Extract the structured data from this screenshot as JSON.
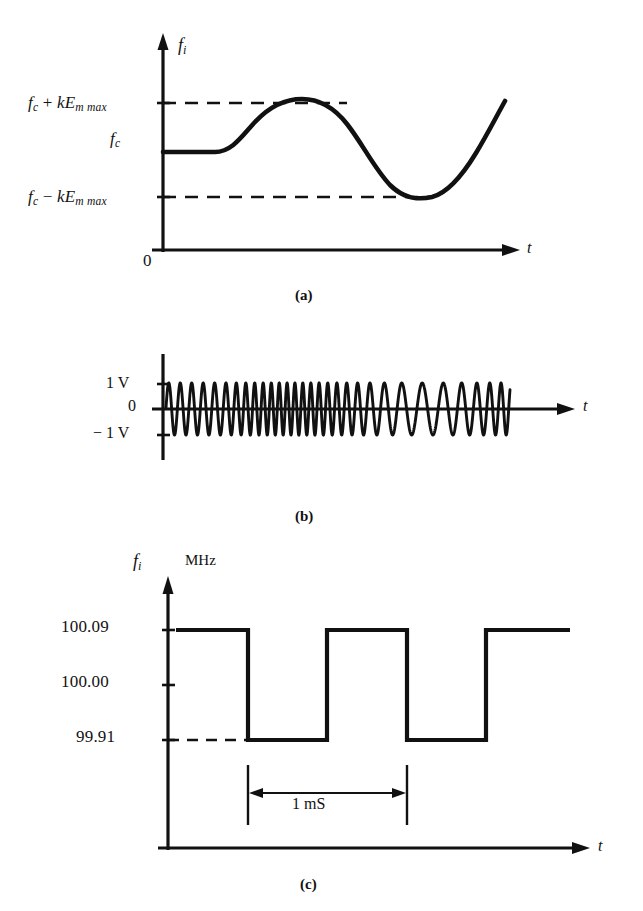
{
  "figure": {
    "title_fragment": "",
    "panels": [
      {
        "id": "a",
        "caption": "(a)",
        "y_axis_label": "f",
        "y_axis_sub": "i",
        "x_axis_label": "t",
        "origin_label": "0",
        "ticks": [
          {
            "text_pre": "f",
            "sub1": "c",
            "op": " + ",
            "text_k": "kE",
            "sub2": "m max",
            "full": "f_c + kE_m max",
            "value_kind": "upper-deviation"
          },
          {
            "text_pre": "f",
            "sub1": "c",
            "op": "",
            "text_k": "",
            "sub2": "",
            "full": "f_c",
            "value_kind": "carrier"
          },
          {
            "text_pre": "f",
            "sub1": "c",
            "op": " − ",
            "text_k": "kE",
            "sub2": "m max",
            "full": "f_c - kE_m max",
            "value_kind": "lower-deviation"
          }
        ]
      },
      {
        "id": "b",
        "caption": "(b)",
        "x_axis_label": "t",
        "ticks": [
          "1 V",
          "0",
          "− 1 V"
        ]
      },
      {
        "id": "c",
        "caption": "(c)",
        "y_axis_label": "f",
        "y_axis_sub": "i",
        "y_axis_unit": "MHz",
        "x_axis_label": "t",
        "ticks": [
          "100.09",
          "100.00",
          "99.91"
        ],
        "period_label": "1 mS"
      }
    ]
  },
  "chart_data": [
    {
      "type": "line",
      "panel": "a",
      "title": "Instantaneous frequency vs time (analog modulation)",
      "xlabel": "t",
      "ylabel": "f_i",
      "ytick_labels": [
        "f_c + kE_m max",
        "f_c",
        "f_c - kE_m max"
      ],
      "ytick_values": [
        1,
        0,
        -1
      ],
      "ylim": [
        -1.6,
        1.35
      ],
      "grid": false,
      "legend": null,
      "annotations": [
        "dashed guide line at f_c + kE_m max",
        "dashed guide line at f_c - kE_m max",
        "origin marked 0"
      ],
      "series": [
        {
          "name": "f_i(t)",
          "x": [
            0.0,
            0.05,
            0.1,
            0.15,
            0.175,
            0.21,
            0.25,
            0.3,
            0.35,
            0.4,
            0.45,
            0.5,
            0.55,
            0.6,
            0.65,
            0.7,
            0.75,
            0.8,
            0.85,
            0.9,
            0.95,
            1.0
          ],
          "y": [
            0.0,
            0.0,
            0.0,
            0.0,
            0.02,
            0.22,
            0.62,
            0.93,
            1.0,
            0.95,
            0.76,
            0.45,
            0.08,
            -0.35,
            -0.72,
            -0.94,
            -1.0,
            -0.93,
            -0.7,
            -0.36,
            0.05,
            0.48
          ]
        }
      ]
    },
    {
      "type": "line",
      "panel": "b",
      "title": "Frequency-modulated carrier waveform",
      "xlabel": "t",
      "ylabel": "",
      "ytick_labels": [
        "1 V",
        "0",
        "− 1 V"
      ],
      "ytick_values": [
        1,
        0,
        -1
      ],
      "ylim": [
        -1.35,
        1.35
      ],
      "grid": false,
      "legend": null,
      "annotations": [
        "amplitude constant at 1 V peak",
        "frequency highest where f_i is maximum"
      ],
      "series": [
        {
          "name": "e_FM(t)",
          "amplitude_v": 1,
          "cycle_count_approx": 44,
          "frequency_profile_note": "tracks panel (a): low at start, peak density near 35% of span, low near 70%, rising again at end"
        }
      ]
    },
    {
      "type": "line",
      "panel": "c",
      "title": "Instantaneous frequency vs time (square-wave modulation)",
      "xlabel": "t",
      "ylabel": "f_i",
      "yunit": "MHz",
      "ytick_labels": [
        "100.09",
        "100.00",
        "99.91"
      ],
      "ytick_values": [
        100.09,
        100.0,
        99.91
      ],
      "ylim": [
        99.84,
        100.14
      ],
      "grid": false,
      "legend": null,
      "annotations": [
        "dashed guide line at 99.91",
        "period marker spanning 1 mS between two vertical rules"
      ],
      "period_ms": 1,
      "series": [
        {
          "name": "f_i(t)",
          "waveform": "square",
          "high_value": 100.09,
          "low_value": 99.91,
          "x": [
            0.0,
            0.18,
            0.18,
            0.37,
            0.37,
            0.55,
            0.55,
            0.73,
            0.73,
            0.91,
            0.91,
            1.0
          ],
          "y": [
            100.09,
            100.09,
            99.91,
            99.91,
            100.09,
            100.09,
            99.91,
            99.91,
            100.09,
            100.09,
            100.09,
            100.09
          ]
        }
      ]
    }
  ]
}
